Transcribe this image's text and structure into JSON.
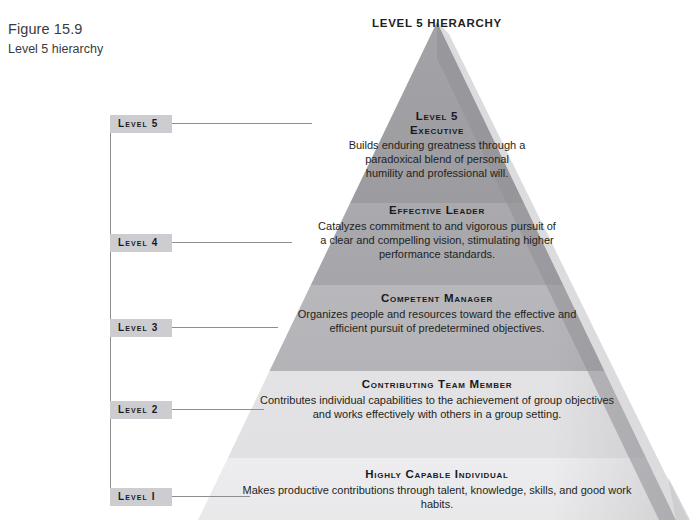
{
  "caption": {
    "figure_number": "Figure 15.9",
    "figure_title": "Level 5 hierarchy"
  },
  "diagram": {
    "title": "LEVEL 5 HIERARCHY",
    "type": "pyramid",
    "colors": {
      "level5_band": "#9d9da2",
      "level4_band": "#a7a7ac",
      "level3_band": "#b6b6ba",
      "level2_band": "#e4e4e6",
      "level1_band": "#ececee",
      "chip_background": "#cdcdd1",
      "rail_line": "#8d8d92",
      "text": "#231f20",
      "shadow_edge": "#8a8a8f"
    },
    "level_chips": [
      {
        "id": "level-5",
        "label": "Level 5"
      },
      {
        "id": "level-4",
        "label": "Level 4"
      },
      {
        "id": "level-3",
        "label": "Level 3"
      },
      {
        "id": "level-2",
        "label": "Level 2"
      },
      {
        "id": "level-1",
        "label": "Level I"
      }
    ],
    "bands": [
      {
        "id": "level-5",
        "title": "Level 5\nExecutive",
        "title_line_1": "Level 5",
        "title_line_2": "Executive",
        "body": "Builds enduring greatness through a paradoxical blend of personal humility and professional will."
      },
      {
        "id": "level-4",
        "title": "Effective Leader",
        "body": "Catalyzes commitment to and vigorous pursuit of a clear and compelling vision, stimulating higher performance standards."
      },
      {
        "id": "level-3",
        "title": "Competent Manager",
        "body": "Organizes people and resources toward the effective and efficient pursuit of predetermined objectives."
      },
      {
        "id": "level-2",
        "title": "Contributing Team Member",
        "body": "Contributes individual capabilities to the achievement of group objectives and works effectively with others in a group setting."
      },
      {
        "id": "level-1",
        "title": "Highly Capable Individual",
        "body": "Makes productive contributions through talent, knowledge, skills, and good work habits."
      }
    ]
  }
}
